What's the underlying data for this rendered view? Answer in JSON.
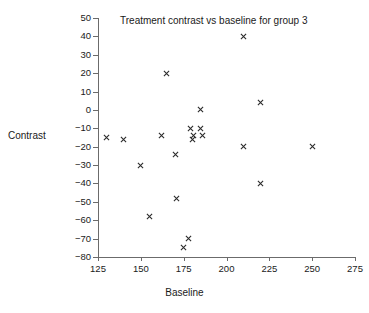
{
  "chart_data": {
    "type": "scatter",
    "title": "Treatment contrast vs baseline for group 3",
    "xlabel": "Baseline",
    "ylabel": "Contrast",
    "xlim": [
      125,
      275
    ],
    "ylim": [
      -80,
      50
    ],
    "xticks": [
      125,
      150,
      175,
      200,
      225,
      250,
      275
    ],
    "yticks": [
      50,
      40,
      30,
      20,
      10,
      0,
      -10,
      -20,
      -30,
      -40,
      -50,
      -60,
      -70,
      -80
    ],
    "xtick_labels": [
      "125",
      "150",
      "175",
      "200",
      "225",
      "250",
      "275"
    ],
    "ytick_labels": [
      "50",
      "40",
      "30",
      "20",
      "10",
      "0",
      "-10",
      "-20",
      "-30",
      "-40",
      "-50",
      "-60",
      "-70",
      "-80"
    ],
    "grid": false,
    "legend": false,
    "marker": "x",
    "marker_color": "#2b2b2b",
    "series": [
      {
        "name": "group 3",
        "x": [
          130,
          140,
          150,
          155,
          162,
          165,
          170,
          171,
          175,
          178,
          179,
          180,
          181,
          185,
          185,
          186,
          210,
          210,
          220,
          220,
          250
        ],
        "y": [
          -15,
          -16,
          -30,
          -58,
          -14,
          20,
          -24,
          -48,
          -75,
          -70,
          -10,
          -16,
          -14,
          -10,
          0,
          -14,
          40,
          -20,
          4,
          -40,
          -20
        ]
      }
    ],
    "points": [
      {
        "x": 130,
        "y": -15
      },
      {
        "x": 140,
        "y": -16
      },
      {
        "x": 150,
        "y": -30
      },
      {
        "x": 155,
        "y": -58
      },
      {
        "x": 162,
        "y": -14
      },
      {
        "x": 165,
        "y": 20
      },
      {
        "x": 170,
        "y": -24
      },
      {
        "x": 171,
        "y": -48
      },
      {
        "x": 175,
        "y": -75
      },
      {
        "x": 178,
        "y": -70
      },
      {
        "x": 179,
        "y": -10
      },
      {
        "x": 180,
        "y": -16
      },
      {
        "x": 181,
        "y": -14
      },
      {
        "x": 185,
        "y": -10
      },
      {
        "x": 185,
        "y": 0
      },
      {
        "x": 186,
        "y": -14
      },
      {
        "x": 210,
        "y": 40
      },
      {
        "x": 210,
        "y": -20
      },
      {
        "x": 220,
        "y": 4
      },
      {
        "x": 220,
        "y": -40
      },
      {
        "x": 250,
        "y": -20
      }
    ]
  }
}
